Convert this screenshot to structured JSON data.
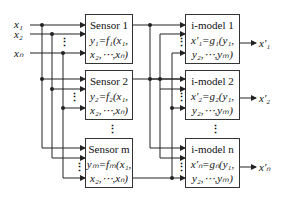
{
  "inputs": [
    {
      "label": "x₁"
    },
    {
      "label": "x₂"
    },
    {
      "label": "xₙ"
    }
  ],
  "sensors": [
    {
      "title": "Sensor 1",
      "line1": "y₁=f₁(x₁,",
      "line2": "x₂,⋯,xₙ)"
    },
    {
      "title": "Sensor 2",
      "line1": "y₂=f₂(x₁,",
      "line2": "x₂,⋯,xₙ)"
    },
    {
      "title": "Sensor m",
      "line1": "yₘ=fₘ(x₁,",
      "line2": "x₂,⋯,xₙ)"
    }
  ],
  "models": [
    {
      "title": "i-model 1",
      "line1": "x′₁=g₁(y₁,",
      "line2": "y₂,⋯,yₘ)"
    },
    {
      "title": "i-model 2",
      "line1": "x′₂=g₂(y₁,",
      "line2": "y₂,⋯,yₘ)"
    },
    {
      "title": "i-model n",
      "line1": "x′ₙ=gₙ(y₁,",
      "line2": "y₂,⋯,yₘ)"
    }
  ],
  "outputs": [
    {
      "label": "x′₁"
    },
    {
      "label": "x′₂"
    },
    {
      "label": "x′ₙ"
    }
  ],
  "ellipsis": "⋮"
}
